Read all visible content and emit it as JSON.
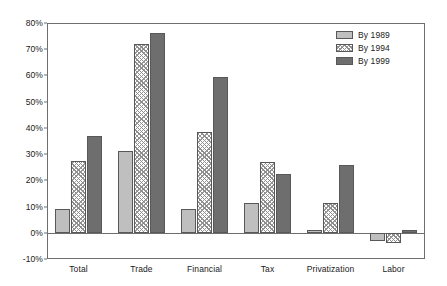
{
  "chart_data": {
    "type": "bar",
    "title": "",
    "subtitle": "",
    "xlabel": "",
    "ylabel": "",
    "ylim": [
      -10,
      80
    ],
    "ytick_labels": [
      "80%",
      "70%",
      "60%",
      "50%",
      "40%",
      "30%",
      "20%",
      "10%",
      "0%",
      "-10%"
    ],
    "ytick_values": [
      80,
      70,
      60,
      50,
      40,
      30,
      20,
      10,
      0,
      -10
    ],
    "grid": false,
    "legend_position": "top-right",
    "categories": [
      "Total",
      "Trade",
      "Financial",
      "Tax",
      "Privatization",
      "Labor"
    ],
    "series": [
      {
        "name": "By 1989",
        "color": "#bfbfbf",
        "pattern": "solid",
        "values": [
          9,
          31,
          9,
          11.5,
          1,
          -3
        ]
      },
      {
        "name": "By 1994",
        "color": "#ffffff",
        "pattern": "crosshatch",
        "values": [
          27.5,
          72,
          38.5,
          27,
          11.5,
          -4
        ]
      },
      {
        "name": "By 1999",
        "color": "#6e6e6e",
        "pattern": "solid",
        "values": [
          37,
          76,
          59.5,
          22.5,
          26,
          1
        ]
      }
    ]
  },
  "legend": {
    "items": [
      {
        "label": "By 1989"
      },
      {
        "label": "By 1994"
      },
      {
        "label": "By 1999"
      }
    ]
  },
  "axis": {
    "y_labels": [
      "80%",
      "70%",
      "60%",
      "50%",
      "40%",
      "30%",
      "20%",
      "10%",
      "0%",
      "-10%"
    ],
    "x_labels": [
      "Total",
      "Trade",
      "Financial",
      "Tax",
      "Privatization",
      "Labor"
    ]
  }
}
